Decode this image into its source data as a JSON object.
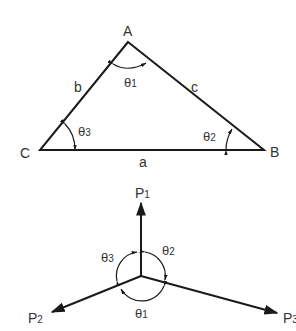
{
  "triangle": {
    "vertices": [
      {
        "name": "A",
        "label": "A"
      },
      {
        "name": "B",
        "label": "B"
      },
      {
        "name": "C",
        "label": "C"
      }
    ],
    "sides": [
      {
        "name": "a",
        "label": "a"
      },
      {
        "name": "b",
        "label": "b"
      },
      {
        "name": "c",
        "label": "c"
      }
    ],
    "angles": [
      {
        "symbol": "θ",
        "sub": "1",
        "at": "A"
      },
      {
        "symbol": "θ",
        "sub": "2",
        "at": "B"
      },
      {
        "symbol": "θ",
        "sub": "3",
        "at": "C"
      }
    ]
  },
  "forces": {
    "vectors": [
      {
        "symbol": "P",
        "sub": "1"
      },
      {
        "symbol": "P",
        "sub": "2"
      },
      {
        "symbol": "P",
        "sub": "3"
      }
    ],
    "angles": [
      {
        "symbol": "θ",
        "sub": "1"
      },
      {
        "symbol": "θ",
        "sub": "2"
      },
      {
        "symbol": "θ",
        "sub": "3"
      }
    ]
  },
  "colors": {
    "line": "#1a1a1a",
    "text": "#333333",
    "background": "#ffffff"
  }
}
